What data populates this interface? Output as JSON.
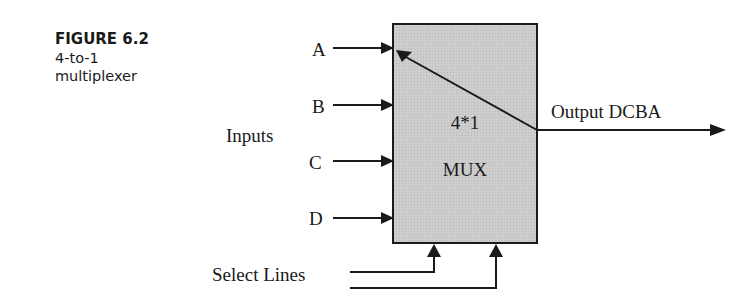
{
  "caption": {
    "figure_number": "FIGURE 6.2",
    "description_line1": "4-to-1",
    "description_line2": "multiplexer"
  },
  "diagram": {
    "block": {
      "label_line1": "4*1",
      "label_line2": "MUX",
      "fill_color": "#c8c8c8",
      "stroke_color": "#1a1a1a"
    },
    "inputs_label": "Inputs",
    "inputs": [
      {
        "label": "A"
      },
      {
        "label": "B"
      },
      {
        "label": "C"
      },
      {
        "label": "D"
      }
    ],
    "output_label": "Output DCBA",
    "select_label": "Select Lines",
    "select_line_count": 2
  }
}
